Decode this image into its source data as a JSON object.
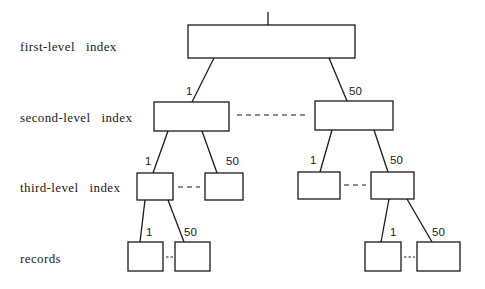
{
  "levels": {
    "first": "first-level   index",
    "second": "second-level   index",
    "third": "third-level   index",
    "records": "records"
  },
  "edge_labels": {
    "root_left": "1",
    "root_right": "50",
    "l2_left_left": "1",
    "l2_left_right": "50",
    "l2_right_left": "1",
    "l2_right_right": "50",
    "l3_left_left": "1",
    "l3_left_right": "50",
    "l3_right_left": "1",
    "l3_right_right": "50"
  },
  "colors": {
    "line": "#1a1a1a",
    "background": "#ffffff"
  }
}
